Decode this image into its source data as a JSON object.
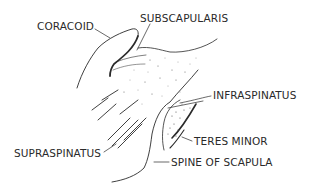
{
  "figure": {
    "type": "anatomical line illustration",
    "ink_color": "#2a2a2a",
    "background": "#ffffff"
  },
  "labels": {
    "coracoid": "CORACOID",
    "subscapularis": "SUBSCAPULARIS",
    "infraspinatus": "INFRASPINATUS",
    "teres_minor": "TERES MINOR",
    "supraspinatus": "SUPRASPINATUS",
    "spine_of_scapula": "SPINE OF SCAPULA"
  }
}
